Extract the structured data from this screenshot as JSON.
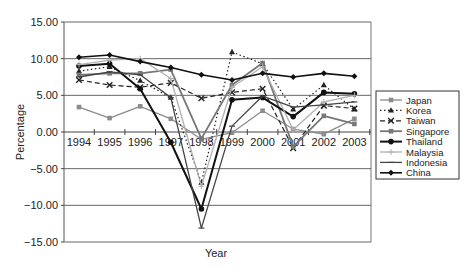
{
  "chart_data": {
    "type": "line",
    "title": "",
    "xlabel": "Year",
    "ylabel": "Percentage",
    "ylim": [
      -15,
      15
    ],
    "yticks": [
      "15.00",
      "10.00",
      "5.00",
      "0.00",
      "-5.00",
      "-10.00",
      "-15.00"
    ],
    "grid": true,
    "legend_position": "right",
    "categories": [
      "1994",
      "1995",
      "1996",
      "1997",
      "1998",
      "1999",
      "2000",
      "2001",
      "2002",
      "2003"
    ],
    "series": [
      {
        "name": "Japan",
        "values": [
          3.4,
          1.9,
          3.5,
          1.8,
          -1.0,
          -0.1,
          2.9,
          0.4,
          -0.3,
          1.8
        ],
        "color": "#8c8c8c",
        "dash": "",
        "marker": "square",
        "width": 1.3
      },
      {
        "name": "Korea",
        "values": [
          8.3,
          8.9,
          7.0,
          4.7,
          -6.9,
          10.9,
          9.3,
          3.1,
          6.4,
          3.1
        ],
        "color": "#222222",
        "dash": "1.5,2.5",
        "marker": "triangle",
        "width": 1.2
      },
      {
        "name": "Taiwan",
        "values": [
          7.1,
          6.4,
          6.1,
          6.7,
          4.6,
          5.4,
          5.9,
          -2.2,
          3.6,
          3.2
        ],
        "color": "#222222",
        "dash": "5,3",
        "marker": "x",
        "width": 1.2
      },
      {
        "name": "Singapore",
        "values": [
          7.8,
          8.0,
          8.0,
          8.5,
          -0.9,
          6.4,
          9.4,
          -2.0,
          2.2,
          1.1
        ],
        "color": "#777777",
        "dash": "",
        "marker": "square",
        "width": 1.8
      },
      {
        "name": "Thailand",
        "values": [
          9.0,
          9.3,
          5.9,
          -1.4,
          -10.5,
          4.4,
          4.7,
          2.1,
          5.4,
          5.2
        ],
        "color": "#111111",
        "dash": "",
        "marker": "circle",
        "width": 2.0
      },
      {
        "name": "Malaysia",
        "values": [
          9.2,
          9.8,
          10.0,
          7.3,
          -7.4,
          6.1,
          8.9,
          0.3,
          4.1,
          5.0
        ],
        "color": "#b0b0b0",
        "dash": "",
        "marker": "plus",
        "width": 1.3
      },
      {
        "name": "Indonesia",
        "values": [
          7.5,
          8.2,
          7.8,
          4.7,
          -13.1,
          0.8,
          4.9,
          3.4,
          3.7,
          4.1
        ],
        "color": "#444444",
        "dash": "",
        "marker": "dash",
        "width": 1.3
      },
      {
        "name": "China",
        "values": [
          10.2,
          10.5,
          9.6,
          8.8,
          7.8,
          7.1,
          8.0,
          7.5,
          8.0,
          7.6
        ],
        "color": "#111111",
        "dash": "",
        "marker": "diamond",
        "width": 1.6
      }
    ]
  },
  "legend": {
    "items": [
      "Japan",
      "Korea",
      "Taiwan",
      "Singapore",
      "Thailand",
      "Malaysia",
      "Indonesia",
      "China"
    ]
  }
}
